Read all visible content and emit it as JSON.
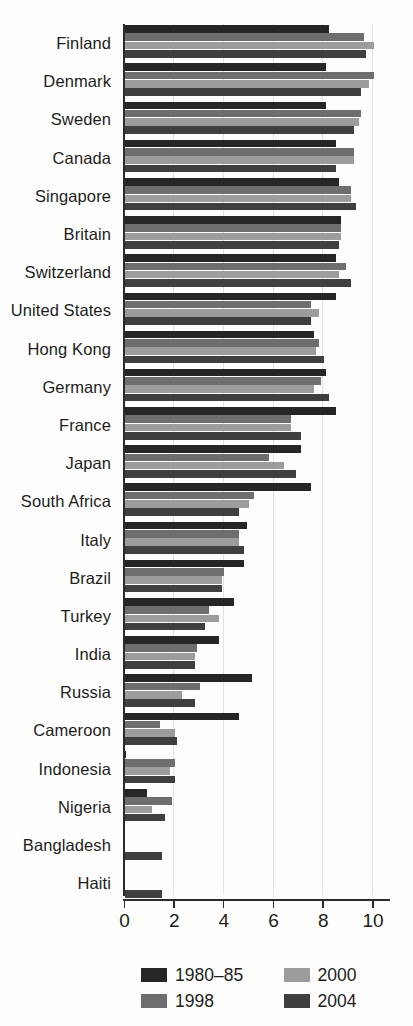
{
  "chart_data": {
    "type": "bar",
    "orientation": "horizontal",
    "title": "",
    "subtitle": "",
    "xlabel": "",
    "ylabel": "",
    "xlim": [
      0,
      10.8
    ],
    "xticks": [
      0,
      2,
      4,
      6,
      8,
      10
    ],
    "xtick_labels": [
      "0",
      "2",
      "4",
      "6",
      "8",
      "10"
    ],
    "grid": true,
    "legend_position": "bottom",
    "categories": [
      "Finland",
      "Denmark",
      "Sweden",
      "Canada",
      "Singapore",
      "Britain",
      "Switzerland",
      "United States",
      "Hong Kong",
      "Germany",
      "France",
      "Japan",
      "South Africa",
      "Italy",
      "Brazil",
      "Turkey",
      "India",
      "Russia",
      "Cameroon",
      "Indonesia",
      "Nigeria",
      "Bangladesh",
      "Haiti"
    ],
    "series": [
      {
        "name": "1980–85",
        "color": "#262626",
        "values": [
          8.2,
          8.1,
          8.1,
          8.5,
          8.6,
          8.7,
          8.5,
          8.5,
          7.6,
          8.1,
          8.5,
          7.1,
          7.5,
          4.9,
          4.8,
          4.4,
          3.8,
          5.1,
          4.6,
          0.05,
          0.9,
          0,
          0
        ]
      },
      {
        "name": "1998",
        "color": "#6e6e6e",
        "values": [
          9.6,
          10.0,
          9.5,
          9.2,
          9.1,
          8.7,
          8.9,
          7.5,
          7.8,
          7.9,
          6.7,
          5.8,
          5.2,
          4.6,
          4.0,
          3.4,
          2.9,
          3.0,
          1.4,
          2.0,
          1.9,
          0,
          0
        ]
      },
      {
        "name": "2000",
        "color": "#9c9c9c",
        "values": [
          10.0,
          9.8,
          9.4,
          9.2,
          9.1,
          8.7,
          8.6,
          7.8,
          7.7,
          7.6,
          6.7,
          6.4,
          5.0,
          4.6,
          3.9,
          3.8,
          2.8,
          2.3,
          2.0,
          1.8,
          1.1,
          0,
          0
        ]
      },
      {
        "name": "2004",
        "color": "#3f3f3f",
        "values": [
          9.7,
          9.5,
          9.2,
          8.5,
          9.3,
          8.6,
          9.1,
          7.5,
          8.0,
          8.2,
          7.1,
          6.9,
          4.6,
          4.8,
          3.9,
          3.2,
          2.8,
          2.8,
          2.1,
          2.0,
          1.6,
          1.5,
          1.5
        ]
      }
    ]
  },
  "axis": {
    "tick_labels": [
      "0",
      "2",
      "4",
      "6",
      "8",
      "10"
    ]
  },
  "legend": {
    "items": [
      {
        "label": "1980–85",
        "swatch": "s0"
      },
      {
        "label": "2000",
        "swatch": "s2"
      },
      {
        "label": "1998",
        "swatch": "s1"
      },
      {
        "label": "2004",
        "swatch": "s3"
      }
    ]
  }
}
